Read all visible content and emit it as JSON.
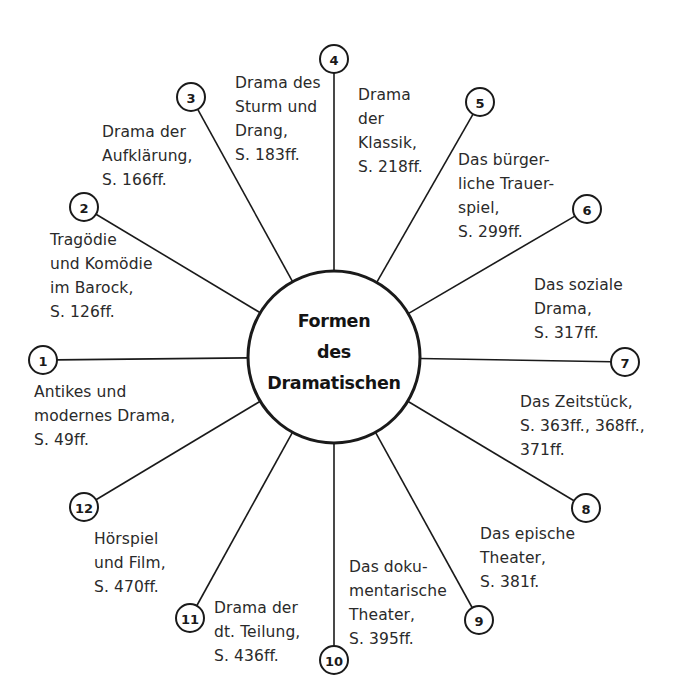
{
  "center": {
    "lines": [
      "Formen",
      "des",
      "Dramatischen"
    ],
    "cx": 334,
    "cy": 357,
    "r": 86
  },
  "node_radius": 14,
  "colors": {
    "stroke": "#1a1a1a",
    "text": "#2a2a2a",
    "background": "#ffffff"
  },
  "nodes": [
    {
      "number": "1",
      "x": 43,
      "y": 360,
      "label": [
        "Antikes und",
        "modernes Drama,",
        "S. 49ff."
      ],
      "label_x": 34,
      "label_y": 380
    },
    {
      "number": "2",
      "x": 84,
      "y": 207,
      "label": [
        "Tragödie",
        "und Komödie",
        "im Barock,",
        "S. 126ff."
      ],
      "label_x": 50,
      "label_y": 228
    },
    {
      "number": "3",
      "x": 191,
      "y": 97,
      "label": [
        "Drama der",
        "Aufklärung,",
        "S. 166ff."
      ],
      "label_x": 102,
      "label_y": 120
    },
    {
      "number": "4",
      "x": 334,
      "y": 59,
      "label": [
        "Drama des",
        "Sturm und",
        "Drang,",
        "S. 183ff."
      ],
      "label_x": 235,
      "label_y": 71
    },
    {
      "number": "5",
      "x": 480,
      "y": 102,
      "label": [
        "Drama",
        "der",
        "Klassik,",
        "S. 218ff."
      ],
      "label_x": 358,
      "label_y": 83
    },
    {
      "number": "6",
      "x": 587,
      "y": 209,
      "label": [
        "Das bürger-",
        "liche Trauer-",
        "spiel,",
        "S. 299ff."
      ],
      "label_x": 458,
      "label_y": 148
    },
    {
      "number": "7",
      "x": 625,
      "y": 362,
      "label": [
        "Das soziale",
        "Drama,",
        "S. 317ff."
      ],
      "label_x": 534,
      "label_y": 273
    },
    {
      "number": "8",
      "x": 586,
      "y": 508,
      "label": [
        "Das Zeitstück,",
        "S. 363ff., 368ff.,",
        "371ff."
      ],
      "label_x": 520,
      "label_y": 390
    },
    {
      "number": "9",
      "x": 479,
      "y": 620,
      "label": [
        "Das epische",
        "Theater,",
        "S. 381f."
      ],
      "label_x": 480,
      "label_y": 522
    },
    {
      "number": "10",
      "x": 334,
      "y": 660,
      "label": [
        "Das doku-",
        "mentarische",
        "Theater,",
        "S. 395ff."
      ],
      "label_x": 349,
      "label_y": 555
    },
    {
      "number": "11",
      "x": 190,
      "y": 618,
      "label": [
        "Drama der",
        "dt. Teilung,",
        "S. 436ff."
      ],
      "label_x": 214,
      "label_y": 596
    },
    {
      "number": "12",
      "x": 84,
      "y": 507,
      "label": [
        "Hörspiel",
        "und Film,",
        "S. 470ff."
      ],
      "label_x": 94,
      "label_y": 527
    }
  ]
}
